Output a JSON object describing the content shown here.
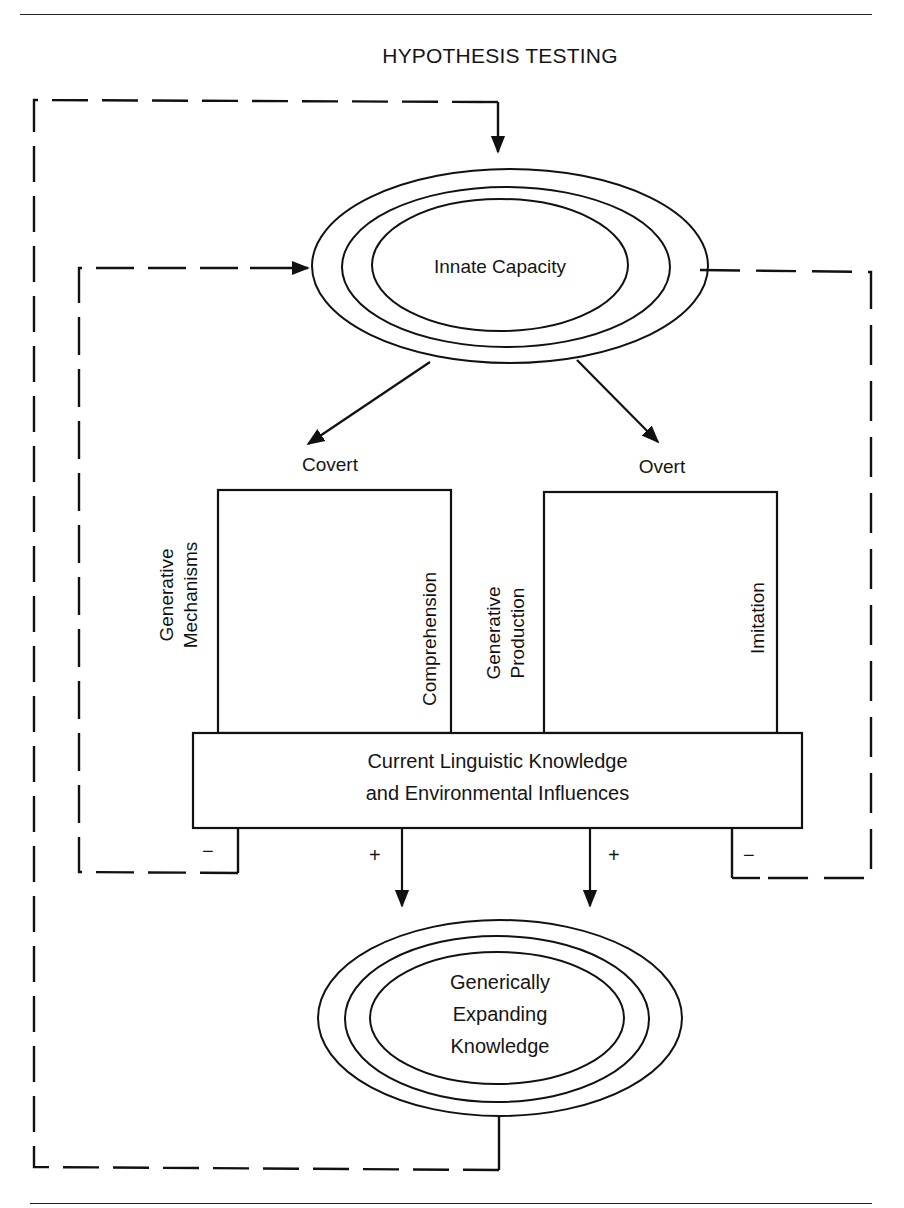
{
  "title": "HYPOTHESIS TESTING",
  "nodes": {
    "innate_capacity": {
      "label": "Innate Capacity",
      "shape": "triple-ellipse"
    },
    "covert": {
      "label": "Covert"
    },
    "overt": {
      "label": "Overt"
    },
    "covert_box": {
      "left_label_line1": "Generative",
      "left_label_line2": "Mechanisms",
      "right_label": "Comprehension"
    },
    "overt_box": {
      "left_label_line1": "Generative",
      "left_label_line2": "Production",
      "right_label": "Imitation"
    },
    "base_box": {
      "line1": "Current Linguistic Knowledge",
      "line2": "and Environmental Influences"
    },
    "expanding_knowledge": {
      "line1": "Generically",
      "line2": "Expanding",
      "line3": "Knowledge",
      "shape": "triple-ellipse"
    }
  },
  "signs": {
    "left_minus": "−",
    "left_plus": "+",
    "right_plus": "+",
    "right_minus": "−"
  },
  "edges": [
    {
      "from": "Innate Capacity",
      "to": "Covert",
      "style": "solid-arrow"
    },
    {
      "from": "Innate Capacity",
      "to": "Overt",
      "style": "solid-arrow"
    },
    {
      "from": "Current Linguistic Knowledge and Environmental Influences",
      "to": "Generically Expanding Knowledge",
      "style": "solid-arrow",
      "sign": "+",
      "count": 2
    },
    {
      "from": "Current Linguistic Knowledge and Environmental Influences",
      "to": "Innate Capacity",
      "style": "dashed-arrow",
      "sign": "−",
      "side": "left"
    },
    {
      "from": "Innate Capacity",
      "to": "Current Linguistic Knowledge and Environmental Influences",
      "style": "dashed-line",
      "sign": "−",
      "side": "right"
    },
    {
      "from": "Generically Expanding Knowledge",
      "to": "Innate Capacity",
      "style": "dashed-arrow",
      "side": "outer-left"
    }
  ],
  "colors": {
    "ink": "#111111",
    "background": "#ffffff"
  }
}
